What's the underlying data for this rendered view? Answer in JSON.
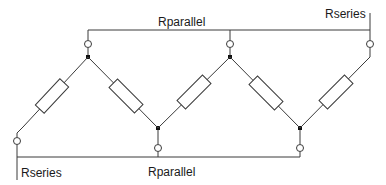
{
  "diagram": {
    "type": "circuit-schematic",
    "labels": {
      "top_parallel": "Rparallel",
      "top_series": "Rseries",
      "bottom_series": "Rseries",
      "bottom_parallel": "Rparallel"
    },
    "resistor_count": 5,
    "colors": {
      "line": "#3a3a3a",
      "background": "#ffffff",
      "junction": "#111111"
    }
  }
}
